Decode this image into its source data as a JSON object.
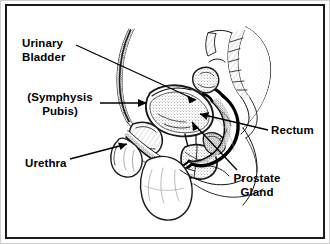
{
  "diagram": {
    "kind": "anatomical-illustration",
    "view": "sagittal section of the male pelvis",
    "background_color": "#ffffff",
    "line_color": "#000000",
    "frame_color": "#1a1a1a",
    "labels": [
      {
        "id": "urinary-bladder",
        "text": "Urinary\nBladder",
        "lines": [
          "Urinary",
          "Bladder"
        ],
        "align": "left"
      },
      {
        "id": "symphysis-pubis",
        "text": "(Symphysis\nPubis)",
        "lines": [
          "(Symphysis",
          "Pubis)"
        ],
        "align": "center"
      },
      {
        "id": "urethra",
        "text": "Urethra",
        "lines": [
          "Urethra"
        ],
        "align": "left"
      },
      {
        "id": "rectum",
        "text": "Rectum",
        "lines": [
          "Rectum"
        ],
        "align": "left"
      },
      {
        "id": "prostate-gland",
        "text": "Prostate\nGland",
        "lines": [
          "Prostate",
          "Gland"
        ],
        "align": "center"
      }
    ]
  }
}
